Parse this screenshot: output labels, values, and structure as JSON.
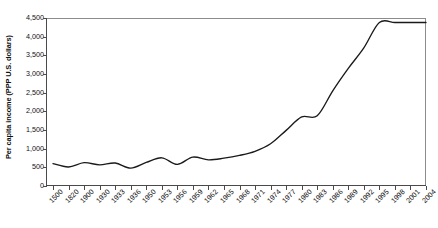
{
  "chart_data": {
    "type": "line",
    "title": "",
    "xlabel": "",
    "ylabel": "Per capita income (PPP U.S. dollars)",
    "ylim": [
      0,
      4500
    ],
    "ytick_labels": [
      "4,500",
      "4,000",
      "3,500",
      "3,000",
      "2,500",
      "2,000",
      "1,500",
      "1,000",
      "500",
      "0"
    ],
    "ytick_values": [
      4500,
      4000,
      3500,
      3000,
      2500,
      2000,
      1500,
      1000,
      500,
      0
    ],
    "grid": false,
    "legend": "none",
    "categories": [
      "1500",
      "1820",
      "1900",
      "1930",
      "1933",
      "1936",
      "1950",
      "1953",
      "1956",
      "1959",
      "1962",
      "1965",
      "1968",
      "1971",
      "1974",
      "1977",
      "1980",
      "1983",
      "1986",
      "1989",
      "1992",
      "1995",
      "1998",
      "2001",
      "2004"
    ],
    "values": [
      600,
      510,
      625,
      565,
      615,
      480,
      630,
      755,
      580,
      775,
      700,
      745,
      820,
      930,
      1130,
      1490,
      1850,
      1880,
      2550,
      3150,
      3700,
      4380,
      4380,
      4380,
      4380
    ],
    "series": [
      {
        "name": "Per capita income",
        "points": [
          {
            "x": "1500",
            "y": 600
          },
          {
            "x": "1820",
            "y": 510
          },
          {
            "x": "1900",
            "y": 625
          },
          {
            "x": "1930",
            "y": 565
          },
          {
            "x": "1933",
            "y": 615
          },
          {
            "x": "1936",
            "y": 480
          },
          {
            "x": "1950",
            "y": 630
          },
          {
            "x": "1953",
            "y": 755
          },
          {
            "x": "1956",
            "y": 580
          },
          {
            "x": "1959",
            "y": 775
          },
          {
            "x": "1962",
            "y": 700
          },
          {
            "x": "1965",
            "y": 745
          },
          {
            "x": "1968",
            "y": 820
          },
          {
            "x": "1971",
            "y": 930
          },
          {
            "x": "1974",
            "y": 1130
          },
          {
            "x": "1977",
            "y": 1490
          },
          {
            "x": "1980",
            "y": 1850
          },
          {
            "x": "1983",
            "y": 1880
          },
          {
            "x": "1986",
            "y": 2550
          },
          {
            "x": "1989",
            "y": 3150
          },
          {
            "x": "1992",
            "y": 3700
          },
          {
            "x": "1995",
            "y": 4380
          }
        ]
      }
    ]
  },
  "colors": {
    "line": "#1a1a1a",
    "axis": "#4a4a4a",
    "frame": "#8c8c8c",
    "background": "#ffffff"
  }
}
